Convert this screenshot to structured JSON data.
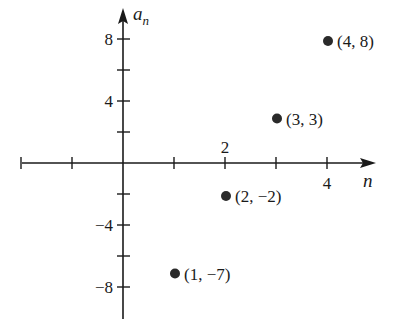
{
  "chart_data": {
    "type": "scatter",
    "title": "",
    "xlabel": "n",
    "ylabel": "a_n",
    "ylabel_main": "a",
    "ylabel_sub": "n",
    "xlim": [
      -2,
      5
    ],
    "ylim": [
      -10,
      9.5
    ],
    "x_ticks": [
      -2,
      -1,
      1,
      2,
      3,
      4
    ],
    "x_tick_labels": [
      {
        "value": 2,
        "label": "2",
        "position": "above"
      },
      {
        "value": 4,
        "label": "4",
        "position": "below"
      }
    ],
    "y_ticks": [
      -8,
      -6,
      -4,
      -2,
      2,
      4,
      6,
      8
    ],
    "y_tick_labels": [
      {
        "value": 8,
        "label": "8"
      },
      {
        "value": 4,
        "label": "4"
      },
      {
        "value": -4,
        "label": "−4"
      },
      {
        "value": -8,
        "label": "−8"
      }
    ],
    "grid": false,
    "legend": null,
    "points": [
      {
        "x": 1,
        "y": -7,
        "label": "(1, −7)"
      },
      {
        "x": 2,
        "y": -2,
        "label": "(2, −2)"
      },
      {
        "x": 3,
        "y": 3,
        "label": "(3, 3)"
      },
      {
        "x": 4,
        "y": 8,
        "label": "(4, 8)"
      }
    ],
    "colors": {
      "axis": "#1a1a1a",
      "point": "#2a2a2a",
      "text": "#1a1a1a"
    }
  }
}
